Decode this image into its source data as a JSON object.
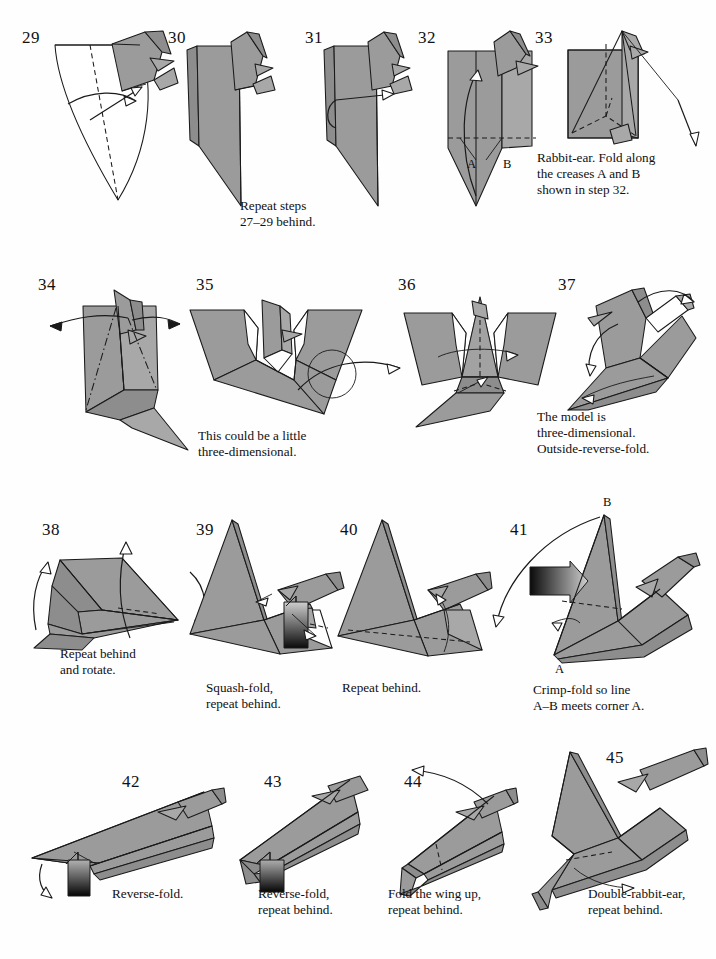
{
  "page": {
    "kind": "origami-instruction-diagram",
    "width": 716,
    "height": 959,
    "background_color": "#ffffff",
    "paper_front_color": "#9b9b9b",
    "paper_back_color": "#ffffff",
    "line_color": "#1a1a1a"
  },
  "rows": [
    {
      "index": 1,
      "steps": [
        "29",
        "30",
        "31",
        "32",
        "33"
      ]
    },
    {
      "index": 2,
      "steps": [
        "34",
        "35",
        "36",
        "37"
      ]
    },
    {
      "index": 3,
      "steps": [
        "38",
        "39",
        "40",
        "41"
      ]
    },
    {
      "index": 4,
      "steps": [
        "42",
        "43",
        "44",
        "45"
      ]
    }
  ],
  "steps": {
    "s29": {
      "number": "29",
      "caption": ""
    },
    "s30": {
      "number": "30",
      "caption": "Repeat steps\n27–29 behind."
    },
    "s31": {
      "number": "31",
      "caption": ""
    },
    "s32": {
      "number": "32",
      "caption": "",
      "label_a": "A",
      "label_b": "B"
    },
    "s33": {
      "number": "33",
      "caption": "Rabbit-ear. Fold along\nthe creases A and B\nshown in step 32."
    },
    "s34": {
      "number": "34",
      "caption": ""
    },
    "s35": {
      "number": "35",
      "caption": "This could be a little\nthree-dimensional."
    },
    "s36": {
      "number": "36",
      "caption": ""
    },
    "s37": {
      "number": "37",
      "caption": "The model is\nthree-dimensional.\nOutside-reverse-fold."
    },
    "s38": {
      "number": "38",
      "caption": "Repeat behind\nand rotate."
    },
    "s39": {
      "number": "39",
      "caption": "Squash-fold,\nrepeat behind."
    },
    "s40": {
      "number": "40",
      "caption": "Repeat behind."
    },
    "s41": {
      "number": "41",
      "caption": "Crimp-fold so line\nA–B meets corner A.",
      "label_a": "A",
      "label_b": "B"
    },
    "s42": {
      "number": "42",
      "caption": "Reverse-fold."
    },
    "s43": {
      "number": "43",
      "caption": "Reverse-fold,\nrepeat behind."
    },
    "s44": {
      "number": "44",
      "caption": "Fold the wing up,\nrepeat behind."
    },
    "s45": {
      "number": "45",
      "caption": "Double-rabbit-ear,\nrepeat behind."
    }
  },
  "symbols": {
    "turn_over": "turn-over-circle-arrow",
    "valley_fold": "dashed-line",
    "mountain_fold": "dash-dot-line",
    "fold_arrow": "hollow-arrowhead",
    "push_arrow": "gradient-filled-arrow"
  }
}
